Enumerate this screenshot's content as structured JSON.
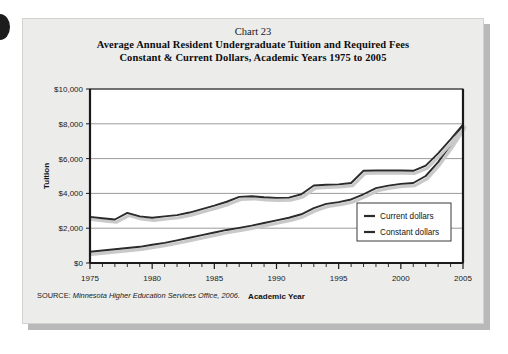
{
  "chart_number": "Chart 23",
  "title_lines": [
    "Average Annual Resident Undergraduate Tuition and Required Fees",
    "Constant & Current Dollars, Academic Years 1975 to 2005"
  ],
  "source": {
    "label": "SOURCE: ",
    "body": "Minnesota Higher Education Services Office, 2006."
  },
  "colors": {
    "card_background": "#ececeb",
    "plot_background": "#ffffff",
    "line_current": "#2b2b2b",
    "line_constant": "#2b2b2b",
    "line_shadow": "#c9c9c9",
    "gridline": "#8f8f8f",
    "axis": "#1a1a1a",
    "text": "#111111"
  },
  "chart_data": {
    "type": "line",
    "title": "Average Annual Resident Undergraduate Tuition and Required Fees\nConstant & Current Dollars, Academic Years 1975 to 2005",
    "xlabel": "Academic Year",
    "ylabel": "Tuition",
    "xlim": [
      1975,
      2005
    ],
    "ylim": [
      0,
      10000
    ],
    "ytick_values": [
      0,
      2000,
      4000,
      6000,
      8000,
      10000
    ],
    "ytick_labels": [
      "$0",
      "$2,000",
      "$4,000",
      "$6,000",
      "$8,000",
      "$10,000"
    ],
    "xtick_values": [
      1975,
      1980,
      1985,
      1990,
      1995,
      2000,
      2005
    ],
    "xtick_labels": [
      "1975",
      "1980",
      "1985",
      "1990",
      "1995",
      "2000",
      "2005"
    ],
    "minor_xticks_every": 1,
    "grid": "horizontal",
    "legend_position": "lower-right",
    "x": [
      1975,
      1976,
      1977,
      1978,
      1979,
      1980,
      1981,
      1982,
      1983,
      1984,
      1985,
      1986,
      1987,
      1988,
      1989,
      1990,
      1991,
      1992,
      1993,
      1994,
      1995,
      1996,
      1997,
      1998,
      1999,
      2000,
      2001,
      2002,
      2003,
      2004,
      2005
    ],
    "series": [
      {
        "name": "Current dollars",
        "values": [
          650,
          720,
          790,
          860,
          930,
          1050,
          1160,
          1300,
          1450,
          1600,
          1750,
          1900,
          2020,
          2150,
          2300,
          2450,
          2600,
          2800,
          3150,
          3400,
          3500,
          3650,
          3950,
          4300,
          4450,
          4550,
          4600,
          5000,
          5800,
          6800,
          7900
        ]
      },
      {
        "name": "Constant dollars",
        "values": [
          2650,
          2570,
          2500,
          2880,
          2680,
          2600,
          2680,
          2750,
          2900,
          3100,
          3300,
          3520,
          3800,
          3840,
          3780,
          3740,
          3760,
          3950,
          4450,
          4500,
          4520,
          4600,
          5300,
          5320,
          5320,
          5320,
          5300,
          5600,
          6300,
          7100,
          7950
        ]
      }
    ]
  },
  "legend": {
    "items": [
      {
        "label": "Current dollars"
      },
      {
        "label": "Constant dollars"
      }
    ]
  }
}
